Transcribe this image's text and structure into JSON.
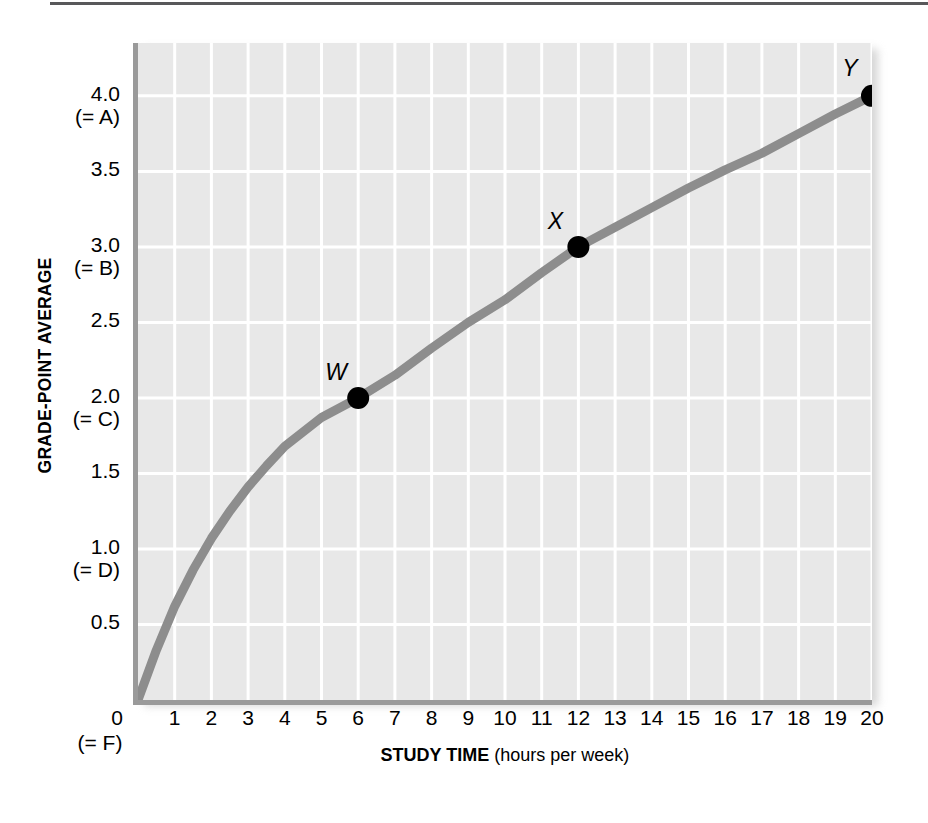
{
  "chart_data": {
    "type": "line",
    "title": "",
    "xlabel": "STUDY TIME (hours per week)",
    "xlabel_bold_part": "STUDY TIME",
    "xlabel_plain_part": "(hours per week)",
    "ylabel": "GRADE-POINT AVERAGE",
    "xlim": [
      0,
      20
    ],
    "ylim": [
      0,
      4.35
    ],
    "grid": true,
    "legend": "none",
    "x_ticks": [
      "0",
      "1",
      "2",
      "3",
      "4",
      "5",
      "6",
      "7",
      "8",
      "9",
      "10",
      "11",
      "12",
      "13",
      "14",
      "15",
      "16",
      "17",
      "18",
      "19",
      "20"
    ],
    "x_tick_sub": [
      {
        "at": 0,
        "text": "(= F)"
      }
    ],
    "y_ticks": [
      {
        "value": 4.0,
        "label": "4.0",
        "grade": "(= A)"
      },
      {
        "value": 3.5,
        "label": "3.5",
        "grade": ""
      },
      {
        "value": 3.0,
        "label": "3.0",
        "grade": "(= B)"
      },
      {
        "value": 2.5,
        "label": "2.5",
        "grade": ""
      },
      {
        "value": 2.0,
        "label": "2.0",
        "grade": "(= C)"
      },
      {
        "value": 1.5,
        "label": "1.5",
        "grade": ""
      },
      {
        "value": 1.0,
        "label": "1.0",
        "grade": "(= D)"
      },
      {
        "value": 0.5,
        "label": "0.5",
        "grade": ""
      }
    ],
    "series": [
      {
        "name": "GPA vs study time",
        "color": "#8d8d8d",
        "x": [
          0,
          0.5,
          1,
          1.5,
          2,
          2.5,
          3,
          3.5,
          4,
          5,
          6,
          7,
          8,
          9,
          10,
          11,
          12,
          13,
          14,
          15,
          16,
          17,
          18,
          19,
          20
        ],
        "y": [
          0,
          0.33,
          0.62,
          0.86,
          1.07,
          1.25,
          1.41,
          1.55,
          1.68,
          1.87,
          2.0,
          2.15,
          2.33,
          2.5,
          2.65,
          2.83,
          3.0,
          3.13,
          3.26,
          3.39,
          3.51,
          3.62,
          3.75,
          3.88,
          4.0
        ]
      }
    ],
    "annotated_points": [
      {
        "label": "W",
        "x": 6,
        "y": 2.0,
        "label_dx": -22,
        "label_dy": -26
      },
      {
        "label": "X",
        "x": 12,
        "y": 3.0,
        "label_dx": -23,
        "label_dy": -26
      },
      {
        "label": "Y",
        "x": 20,
        "y": 4.0,
        "label_dx": -22,
        "label_dy": -28
      }
    ],
    "colors": {
      "plot_background": "#e8e8e8",
      "gridline": "#ffffff",
      "axis": "#9a9a9a",
      "curve": "#8d8d8d",
      "marker": "#000000",
      "text": "#000000",
      "top_rule": "#58585a"
    }
  }
}
